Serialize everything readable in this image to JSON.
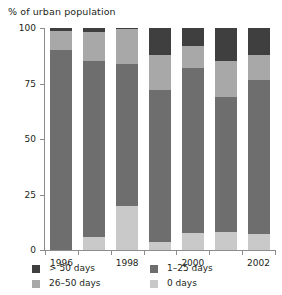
{
  "chart_data": {
    "type": "bar",
    "subtype": "stacked-bar-100",
    "title": "% of urban population",
    "xlabel": "",
    "ylabel": "% of urban population",
    "ylim": [
      0,
      100
    ],
    "yticks": [
      0,
      25,
      50,
      75,
      100
    ],
    "ytick_labels": [
      "0",
      "25",
      "50",
      "75",
      "100"
    ],
    "grid": false,
    "legend_position": "bottom",
    "categories": [
      "1996",
      "1997",
      "1998",
      "1999",
      "2000",
      "2001",
      "2002"
    ],
    "xtick_labels": [
      "1996",
      "1998",
      "2000",
      "2002"
    ],
    "xtick_label_categories": [
      "1996",
      "1998",
      "2000",
      "2002"
    ],
    "stack_order_bottom_to_top": [
      "0 days",
      "1-25 days",
      "26-50 days",
      "> 50 days"
    ],
    "series": [
      {
        "name": "0 days",
        "color": "#c9c9c9",
        "values": [
          0,
          6,
          20,
          3.5,
          7.5,
          8,
          7
        ]
      },
      {
        "name": "1-25 days",
        "color": "#6e6e6e",
        "values": [
          90,
          79,
          64,
          68.5,
          74.5,
          61,
          69.5
        ]
      },
      {
        "name": "26-50 days",
        "color": "#a8a8a8",
        "values": [
          8.5,
          13,
          15.5,
          16,
          10,
          16,
          11.5
        ]
      },
      {
        "name": "> 50 days",
        "color": "#3f3f3f",
        "values": [
          1.5,
          2,
          0.5,
          12,
          8,
          15,
          12
        ]
      }
    ]
  },
  "legend": {
    "entries": [
      {
        "label": "> 50 days",
        "color": "#3f3f3f"
      },
      {
        "label": "1–25 days",
        "color": "#6e6e6e"
      },
      {
        "label": "26–50 days",
        "color": "#a8a8a8"
      },
      {
        "label": "0 days",
        "color": "#c9c9c9"
      }
    ]
  },
  "colors": {
    "axis": "#8c8c8c",
    "text": "#231f20",
    "background": "#ffffff"
  }
}
